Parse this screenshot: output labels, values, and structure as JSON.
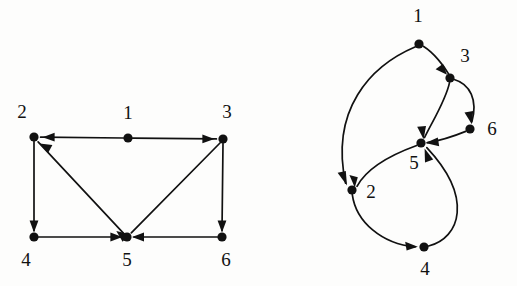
{
  "figure": {
    "background_color": "#fdfdfc",
    "ink_color": "#111111",
    "width": 517,
    "height": 286
  },
  "graphs": [
    {
      "id": "left-graph",
      "name": "straight-line-drawing",
      "layout": "straight",
      "nodes": [
        {
          "id": "1",
          "label": "1",
          "x": 128,
          "y": 138,
          "label_x": 128,
          "label_y": 115
        },
        {
          "id": "2",
          "label": "2",
          "x": 34,
          "y": 137,
          "label_x": 22,
          "label_y": 114
        },
        {
          "id": "3",
          "label": "3",
          "x": 223,
          "y": 139,
          "label_x": 227,
          "label_y": 114
        },
        {
          "id": "4",
          "label": "4",
          "x": 34,
          "y": 237,
          "label_x": 26,
          "label_y": 262
        },
        {
          "id": "5",
          "label": "5",
          "x": 127,
          "y": 237,
          "label_x": 127,
          "label_y": 262
        },
        {
          "id": "6",
          "label": "6",
          "x": 222,
          "y": 237,
          "label_x": 226,
          "label_y": 262
        }
      ],
      "edges": [
        {
          "from": "1",
          "to": "2",
          "type": "line"
        },
        {
          "from": "1",
          "to": "3",
          "type": "line"
        },
        {
          "from": "2",
          "to": "4",
          "type": "line"
        },
        {
          "from": "5",
          "to": "2",
          "type": "line"
        },
        {
          "from": "4",
          "to": "5",
          "type": "line"
        },
        {
          "from": "3",
          "to": "5",
          "type": "line"
        },
        {
          "from": "3",
          "to": "6",
          "type": "line"
        },
        {
          "from": "6",
          "to": "5",
          "type": "line"
        }
      ]
    },
    {
      "id": "right-graph",
      "name": "curved-drawing",
      "layout": "curved",
      "nodes": [
        {
          "id": "1",
          "label": "1",
          "x": 419,
          "y": 44,
          "label_x": 418,
          "label_y": 18
        },
        {
          "id": "3",
          "label": "3",
          "x": 450,
          "y": 78,
          "label_x": 465,
          "label_y": 58
        },
        {
          "id": "6",
          "label": "6",
          "x": 470,
          "y": 129,
          "label_x": 492,
          "label_y": 131
        },
        {
          "id": "5",
          "label": "5",
          "x": 421,
          "y": 143,
          "label_x": 414,
          "label_y": 165
        },
        {
          "id": "2",
          "label": "2",
          "x": 352,
          "y": 190,
          "label_x": 371,
          "label_y": 194
        },
        {
          "id": "4",
          "label": "4",
          "x": 424,
          "y": 247,
          "label_x": 425,
          "label_y": 271
        }
      ],
      "edges": [
        {
          "from": "1",
          "to": "2",
          "type": "curve"
        },
        {
          "from": "1",
          "to": "3",
          "type": "curve"
        },
        {
          "from": "3",
          "to": "5",
          "type": "curve"
        },
        {
          "from": "3",
          "to": "6",
          "type": "curve"
        },
        {
          "from": "6",
          "to": "5",
          "type": "curve"
        },
        {
          "from": "5",
          "to": "2",
          "type": "curve"
        },
        {
          "from": "2",
          "to": "4",
          "type": "curve"
        },
        {
          "from": "4",
          "to": "5",
          "type": "curve"
        }
      ]
    }
  ],
  "geometry": {
    "node_radius": 4.6,
    "arrow_length": 12,
    "arrow_half_width": 4.4,
    "left_edge_paths": [
      {
        "name": "1-to-2",
        "d": "M 123.4 138 L 40.6 137.2"
      },
      {
        "name": "1-to-3",
        "d": "M 132.6 138.1 L 216.4 138.9"
      },
      {
        "name": "2-to-4",
        "d": "M 34 141.6 L 34 230.4"
      },
      {
        "name": "5-to-2",
        "d": "M 123.6 233.3 L 38.1 141.9"
      },
      {
        "name": "4-to-5",
        "d": "M 38.6 237 L 120.4 237"
      },
      {
        "name": "3-to-5",
        "d": "M 220 143 L 131.3 232.8"
      },
      {
        "name": "3-to-6",
        "d": "M 223 143.6 L 222 230.4"
      },
      {
        "name": "6-to-5",
        "d": "M 217.4 237 L 134 237"
      }
    ],
    "right_edge_paths": [
      {
        "name": "1-to-2",
        "d": "M 415.5 46.8 C 370 66 330 110 345.6 183.2"
      },
      {
        "name": "1-to-3",
        "d": "M 423.3 46.3 C 434 53 444 66 448.4 73.6"
      },
      {
        "name": "3-to-5",
        "d": "M 449.5 82.6 C 446 100 432 122 424.6 137.5"
      },
      {
        "name": "3-to-6",
        "d": "M 454.2 79.5 C 470 84 478 100 471.9 121.8"
      },
      {
        "name": "6-to-5",
        "d": "M 465.7 131.4 C 452 137 438 141 427.4 142.7"
      },
      {
        "name": "5-to-2",
        "d": "M 416.7 145.5 C 396 153 368 166 357 186.3"
      },
      {
        "name": "2-to-4",
        "d": "M 352.3 194.6 C 356 222 382 244 415 246.9"
      },
      {
        "name": "4-to-5",
        "d": "M 428.6 246 C 460 238 474 198 426.8 147.6"
      }
    ]
  }
}
